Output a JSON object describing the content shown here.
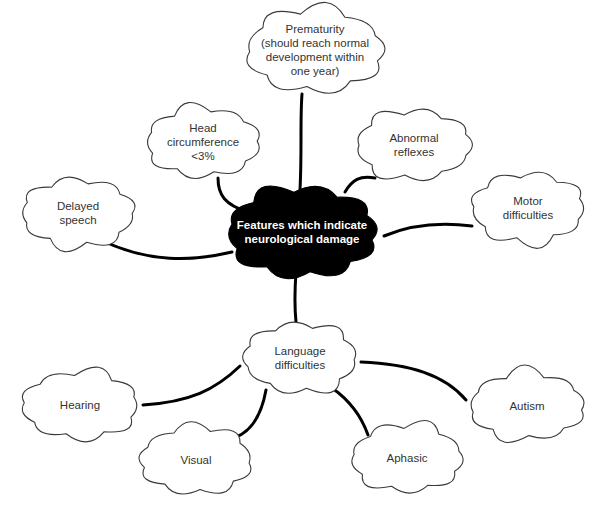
{
  "diagram": {
    "type": "mind-map",
    "central": {
      "id": "central",
      "label": "Features which indicate\nneurological damage",
      "cx": 302,
      "cy": 232,
      "w": 166,
      "h": 100,
      "fill": "#000000",
      "text_color": "#ffffff"
    },
    "nodes": [
      {
        "id": "prematurity",
        "label": "Prematurity\n(should reach normal\ndevelopment within\none year)",
        "cx": 315,
        "cy": 50,
        "w": 152,
        "h": 92
      },
      {
        "id": "head-circumference",
        "label": "Head\ncircumference\n<3%",
        "cx": 203,
        "cy": 142,
        "w": 126,
        "h": 76
      },
      {
        "id": "abnormal-reflexes",
        "label": "Abnormal\nreflexes",
        "cx": 414,
        "cy": 145,
        "w": 128,
        "h": 76
      },
      {
        "id": "delayed-speech",
        "label": "Delayed\nspeech",
        "cx": 78,
        "cy": 213,
        "w": 126,
        "h": 74
      },
      {
        "id": "motor-difficulties",
        "label": "Motor\ndifficulties",
        "cx": 528,
        "cy": 208,
        "w": 126,
        "h": 76
      },
      {
        "id": "language-difficulties",
        "label": "Language\ndifficulties",
        "cx": 300,
        "cy": 358,
        "w": 126,
        "h": 76
      },
      {
        "id": "hearing",
        "label": "Hearing",
        "cx": 80,
        "cy": 405,
        "w": 130,
        "h": 74
      },
      {
        "id": "visual",
        "label": "Visual",
        "cx": 196,
        "cy": 460,
        "w": 124,
        "h": 74
      },
      {
        "id": "aphasic",
        "label": "Aphasic",
        "cx": 407,
        "cy": 458,
        "w": 124,
        "h": 74
      },
      {
        "id": "autism",
        "label": "Autism",
        "cx": 527,
        "cy": 406,
        "w": 128,
        "h": 74
      }
    ],
    "edges": [
      {
        "from": "central",
        "to": "prematurity",
        "path": "M300,190 C302,150 300,120 302,94"
      },
      {
        "from": "central",
        "to": "head-circumference",
        "path": "M248,212 C225,205 218,195 218,178"
      },
      {
        "from": "central",
        "to": "abnormal-reflexes",
        "path": "M345,192 C352,180 360,175 375,178"
      },
      {
        "from": "central",
        "to": "delayed-speech",
        "path": "M232,252 C190,262 150,262 105,242"
      },
      {
        "from": "central",
        "to": "motor-difficulties",
        "path": "M384,236 C410,225 440,222 472,226"
      },
      {
        "from": "central",
        "to": "language-difficulties",
        "path": "M296,272 C294,300 295,312 296,322"
      },
      {
        "from": "language-difficulties",
        "to": "hearing",
        "path": "M240,366 C215,390 190,402 143,405"
      },
      {
        "from": "language-difficulties",
        "to": "visual",
        "path": "M266,390 C262,412 254,430 236,437"
      },
      {
        "from": "language-difficulties",
        "to": "aphasic",
        "path": "M332,388 C352,402 362,418 368,435"
      },
      {
        "from": "language-difficulties",
        "to": "autism",
        "path": "M361,362 C410,364 445,375 466,400"
      }
    ],
    "style": {
      "cloud_fill": "#ffffff",
      "cloud_stroke": "#3a3a3a",
      "edge_color": "#000000",
      "edge_width": 3
    }
  }
}
